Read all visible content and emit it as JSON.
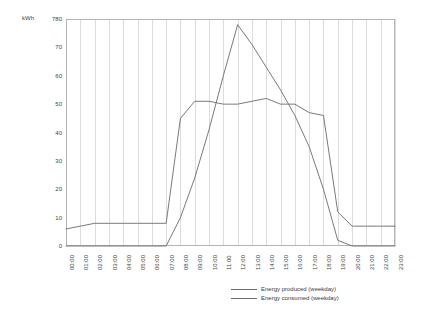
{
  "chart_data": {
    "type": "line",
    "title": "",
    "xlabel": "",
    "ylabel": "kWh",
    "ylim": [
      0,
      80
    ],
    "ytick_step": 10,
    "ytick_labels": [
      "0",
      "10",
      "20",
      "30",
      "40",
      "50",
      "60",
      "70",
      "780"
    ],
    "ytick_values": [
      0,
      10,
      20,
      30,
      40,
      50,
      60,
      70,
      80
    ],
    "grid": "vertical",
    "legend_position": "bottom-right",
    "categories": [
      "00:00",
      "01:00",
      "02:00",
      "03:00",
      "04:00",
      "05:00",
      "06:00",
      "07:00",
      "08:00",
      "09:00",
      "10:00",
      "11:00",
      "12:00",
      "13:00",
      "14:00",
      "15:00",
      "16:00",
      "17:00",
      "18:00",
      "19:00",
      "20:00",
      "21:00",
      "22:00",
      "23:00"
    ],
    "series": [
      {
        "name": "Energy produced (weekday)",
        "color": "#6b6b6b",
        "values": [
          0,
          0,
          0,
          0,
          0,
          0,
          0,
          0,
          10,
          24,
          41,
          60,
          78,
          71,
          63,
          55,
          46,
          35,
          20,
          2,
          0,
          0,
          0,
          0
        ]
      },
      {
        "name": "Energy consumed (weekday)",
        "color": "#6b6b6b",
        "values": [
          6,
          7,
          8,
          8,
          8,
          8,
          8,
          8,
          45,
          51,
          51,
          50,
          50,
          51,
          52,
          50,
          50,
          47,
          46,
          12,
          7,
          7,
          7,
          7
        ]
      }
    ]
  },
  "legend": {
    "items": [
      {
        "label": "Energy produced (weekday)"
      },
      {
        "label": "Energy consumed (weekday)"
      }
    ]
  },
  "axis": {
    "unit_label": "kWh"
  },
  "style": {
    "background": "#ffffff",
    "gridline": "#dcdcdc",
    "border": "#b4b4b4",
    "line": "#6b6b6b",
    "text": "#444444"
  }
}
